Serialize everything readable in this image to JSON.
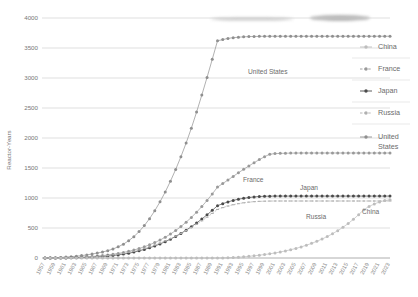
{
  "chart_data": {
    "type": "line",
    "title": "",
    "xlabel": "",
    "ylabel": "Reactor-Years",
    "ylim": [
      0,
      4000
    ],
    "ytick_step": 500,
    "yticks": [
      "0",
      "500",
      "1000",
      "1500",
      "2000",
      "2500",
      "3000",
      "3500",
      "4000"
    ],
    "grid": true,
    "legend_position": "right",
    "x": [
      1957,
      1958,
      1959,
      1960,
      1961,
      1962,
      1963,
      1964,
      1965,
      1966,
      1967,
      1968,
      1969,
      1970,
      1971,
      1972,
      1973,
      1974,
      1975,
      1976,
      1977,
      1978,
      1979,
      1980,
      1981,
      1982,
      1983,
      1984,
      1985,
      1986,
      1987,
      1988,
      1989,
      1990,
      1991,
      1992,
      1993,
      1994,
      1995,
      1996,
      1997,
      1998,
      1999,
      2000,
      2001,
      2002,
      2003,
      2004,
      2005,
      2006,
      2007,
      2008,
      2009,
      2010,
      2011,
      2012,
      2013,
      2014,
      2015,
      2016,
      2017,
      2018,
      2019,
      2020,
      2021,
      2022,
      2023
    ],
    "xticklabels": [
      "1957",
      "1959",
      "1961",
      "1963",
      "1965",
      "1967",
      "1969",
      "1971",
      "1973",
      "1975",
      "1977",
      "1979",
      "1981",
      "1983",
      "1985",
      "1987",
      "1989",
      "1991",
      "1993",
      "1995",
      "1997",
      "1999",
      "2001",
      "2003",
      "2005",
      "2007",
      "2009",
      "2011",
      "2013",
      "2015",
      "2017",
      "2019",
      "2021",
      "2023"
    ],
    "series": [
      {
        "name": "United States",
        "color": "#8f8f8f",
        "marker": "circle",
        "values": [
          1,
          3,
          6,
          10,
          15,
          22,
          30,
          40,
          52,
          66,
          82,
          100,
          122,
          150,
          186,
          231,
          287,
          356,
          440,
          540,
          656,
          788,
          936,
          1100,
          1280,
          1476,
          1688,
          1916,
          2164,
          2432,
          2716,
          3010,
          3312,
          3620,
          3640,
          3660,
          3672,
          3680,
          3686,
          3690,
          3692,
          3694,
          3695,
          3696,
          3696,
          3696,
          3696,
          3696,
          3696,
          3696,
          3696,
          3696,
          3696,
          3696,
          3696,
          3696,
          3696,
          3696,
          3696,
          3696,
          3696,
          3696,
          3696,
          3696,
          3696,
          3696,
          3696
        ]
      },
      {
        "name": "France",
        "color": "#999999",
        "marker": "circle",
        "values": [
          0,
          1,
          2,
          3,
          5,
          7,
          10,
          14,
          19,
          25,
          32,
          40,
          50,
          62,
          76,
          92,
          111,
          133,
          158,
          187,
          220,
          257,
          299,
          346,
          399,
          458,
          524,
          597,
          677,
          764,
          858,
          959,
          1067,
          1182,
          1240,
          1300,
          1360,
          1420,
          1478,
          1534,
          1588,
          1640,
          1688,
          1730,
          1740,
          1744,
          1746,
          1748,
          1749,
          1750,
          1750,
          1750,
          1750,
          1750,
          1750,
          1750,
          1750,
          1750,
          1750,
          1750,
          1750,
          1750,
          1750,
          1750,
          1750,
          1750,
          1750
        ]
      },
      {
        "name": "Japan",
        "color": "#4a4a4a",
        "marker": "circle",
        "values": [
          0,
          0,
          1,
          1,
          2,
          3,
          5,
          7,
          10,
          14,
          19,
          25,
          32,
          41,
          52,
          65,
          80,
          98,
          119,
          143,
          170,
          200,
          234,
          272,
          314,
          360,
          410,
          464,
          522,
          584,
          650,
          720,
          794,
          872,
          905,
          935,
          960,
          980,
          995,
          1008,
          1018,
          1025,
          1029,
          1031,
          1032,
          1032,
          1032,
          1032,
          1032,
          1032,
          1032,
          1032,
          1032,
          1032,
          1032,
          1032,
          1032,
          1032,
          1032,
          1032,
          1032,
          1032,
          1032,
          1032,
          1032,
          1032,
          1032
        ]
      },
      {
        "name": "Russia",
        "color": "#b0b0b0",
        "marker": "dash",
        "values": [
          0,
          1,
          2,
          3,
          5,
          7,
          10,
          13,
          17,
          22,
          28,
          35,
          43,
          53,
          65,
          79,
          95,
          113,
          134,
          158,
          185,
          215,
          248,
          284,
          323,
          365,
          410,
          458,
          509,
          563,
          620,
          680,
          743,
          809,
          840,
          866,
          888,
          906,
          920,
          931,
          939,
          944,
          947,
          949,
          950,
          950,
          950,
          950,
          950,
          950,
          950,
          950,
          950,
          950,
          950,
          950,
          950,
          950,
          950,
          950,
          950,
          950,
          950,
          950,
          950,
          950,
          950
        ]
      },
      {
        "name": "China",
        "color": "#bdbdbd",
        "marker": "circle",
        "values": [
          0,
          0,
          0,
          0,
          0,
          0,
          0,
          0,
          0,
          0,
          0,
          0,
          0,
          0,
          0,
          0,
          0,
          0,
          0,
          0,
          0,
          0,
          0,
          0,
          0,
          0,
          0,
          0,
          0,
          0,
          0,
          0,
          0,
          0,
          2,
          5,
          9,
          14,
          20,
          28,
          37,
          47,
          58,
          70,
          84,
          100,
          118,
          138,
          160,
          185,
          213,
          244,
          278,
          316,
          358,
          404,
          455,
          512,
          575,
          645,
          722,
          805,
          860,
          900,
          935,
          958,
          970
        ]
      }
    ],
    "inline_labels": [
      {
        "text": "United States",
        "x": 248,
        "y": 74
      },
      {
        "text": "France",
        "x": 243,
        "y": 182
      },
      {
        "text": "Japan",
        "x": 300,
        "y": 190
      },
      {
        "text": "Russia",
        "x": 306,
        "y": 219
      },
      {
        "text": "China",
        "x": 362,
        "y": 214
      }
    ]
  },
  "legend": {
    "items": [
      {
        "label": "China"
      },
      {
        "label": "France"
      },
      {
        "label": "Japan"
      },
      {
        "label": "Russia"
      },
      {
        "label": "United"
      },
      {
        "label": "States"
      }
    ]
  }
}
